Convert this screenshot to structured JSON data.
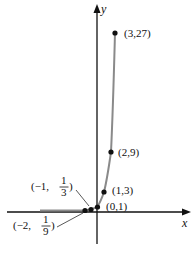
{
  "figure": {
    "function": "y = 3^x",
    "axes": {
      "x_label": "x",
      "y_label": "y"
    },
    "points": [
      {
        "label_main": "(3,27)",
        "x": 3,
        "y": 27
      },
      {
        "label_main": "(2,9)",
        "x": 2,
        "y": 9
      },
      {
        "label_main": "(1,3)",
        "x": 1,
        "y": 3
      },
      {
        "label_main": "(0,1)",
        "x": 0,
        "y": 1
      },
      {
        "label_pre": "(−1,",
        "label_num": "1",
        "label_den": "3",
        "label_post": ")",
        "x": -1,
        "y": "1/3"
      },
      {
        "label_pre": "(−2,",
        "label_num": "1",
        "label_den": "9",
        "label_post": ")",
        "x": -2,
        "y": "1/9"
      }
    ],
    "colors": {
      "curve": "#8a8a8a",
      "axis": "#111111",
      "point": "#111111"
    }
  }
}
